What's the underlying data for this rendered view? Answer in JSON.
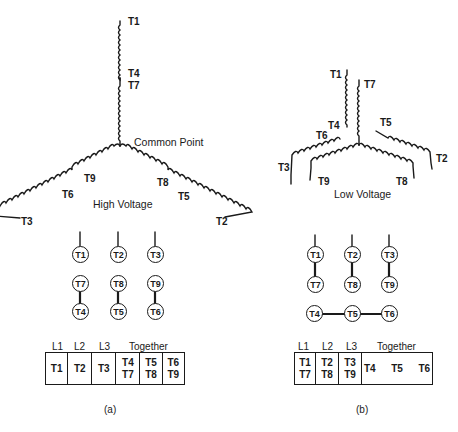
{
  "diagram_a": {
    "caption": "(a)",
    "connection_label": "High Voltage",
    "common_point_label": "Common Point",
    "wye_terminals": {
      "top_end": "T1",
      "top_mid_1": "T4",
      "top_mid_2": "T7",
      "left_mid_inner": "T9",
      "left_mid_outer": "T6",
      "left_end": "T3",
      "right_mid_inner": "T8",
      "right_mid_outer": "T5",
      "right_end": "T2"
    },
    "circles": {
      "row1": [
        "T1",
        "T2",
        "T3"
      ],
      "row2": [
        "T7",
        "T8",
        "T9"
      ],
      "row3": [
        "T4",
        "T5",
        "T6"
      ]
    },
    "table": {
      "headers": [
        "L1",
        "L2",
        "L3",
        "Together"
      ],
      "cells": [
        [
          "T1"
        ],
        [
          "T2"
        ],
        [
          "T3"
        ],
        [
          "T4",
          "T7"
        ],
        [
          "T5",
          "T8"
        ],
        [
          "T6",
          "T9"
        ]
      ]
    }
  },
  "diagram_b": {
    "caption": "(b)",
    "connection_label": "Low Voltage",
    "wye_terminals": {
      "t1": "T1",
      "t7": "T7",
      "t4": "T4",
      "t6": "T6",
      "t5": "T5",
      "t3": "T3",
      "t2": "T2",
      "t9": "T9",
      "t8": "T8"
    },
    "circles": {
      "row1": [
        "T1",
        "T2",
        "T3"
      ],
      "row2": [
        "T7",
        "T8",
        "T9"
      ],
      "row3": [
        "T4",
        "T5",
        "T6"
      ]
    },
    "table": {
      "headers": [
        "L1",
        "L2",
        "L3",
        "Together"
      ],
      "cells": [
        [
          "T1",
          "T7"
        ],
        [
          "T2",
          "T8"
        ],
        [
          "T3",
          "T9"
        ],
        [
          "T4",
          "T5",
          "T6"
        ]
      ]
    }
  }
}
